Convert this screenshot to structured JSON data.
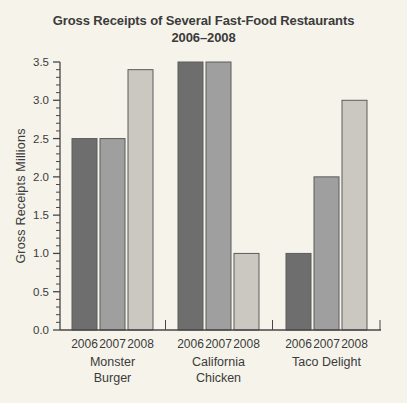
{
  "header": {
    "line1": "Gross Receipts of Several Fast-Food Restaurants",
    "line2": "2006–2008"
  },
  "chart_data": {
    "type": "bar",
    "title": "Gross Receipts of Several Fast-Food Restaurants 2006–2008",
    "ylabel": "Gross Receipts Millions",
    "xlabel": "",
    "ylim": [
      0,
      3.5
    ],
    "y_major_step": 0.5,
    "y_minor_step": 0.1,
    "y_tick_labels": [
      "0.0",
      "0.5",
      "1.0",
      "1.5",
      "2.0",
      "2.5",
      "3.0",
      "3.5"
    ],
    "grid": false,
    "legend_position": "none",
    "categories": [
      "Monster Burger",
      "California Chicken",
      "Taco Delight"
    ],
    "category_labels": [
      [
        "Monster",
        "Burger"
      ],
      [
        "California",
        "Chicken"
      ],
      [
        "Taco Delight"
      ]
    ],
    "series": [
      {
        "name": "2006",
        "color": "#6e6e6e",
        "values": [
          2.5,
          3.5,
          1.0
        ]
      },
      {
        "name": "2007",
        "color": "#9f9f9f",
        "values": [
          2.5,
          3.5,
          2.0
        ]
      },
      {
        "name": "2008",
        "color": "#cac8c1",
        "values": [
          3.4,
          1.0,
          3.0
        ]
      }
    ],
    "bar_outline": "#5c5c5c",
    "axis_color": "#474747",
    "background": "#f5f3ea",
    "text_color": "#3b3b3b"
  }
}
